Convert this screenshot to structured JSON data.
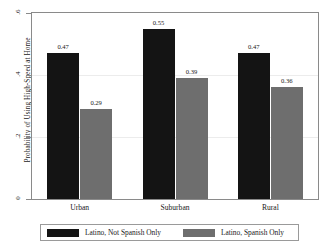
{
  "chart_data": {
    "type": "bar",
    "title": "",
    "subtitle": "",
    "xlabel": "",
    "ylabel": "Probability of Using High-Speed at Home",
    "categories": [
      "Urban",
      "Suburban",
      "Rural"
    ],
    "series": [
      {
        "name": "Latino, Not Spanish Only",
        "color": "#141414",
        "values": [
          0.47,
          0.55,
          0.47
        ],
        "labels": [
          "0.47",
          "0.55",
          "0.47"
        ]
      },
      {
        "name": "Latino, Spanish Only",
        "color": "#6e6e6e",
        "values": [
          0.29,
          0.39,
          0.36
        ],
        "labels": [
          "0.29",
          "0.39",
          "0.36"
        ]
      }
    ],
    "ylim": [
      0,
      0.6
    ],
    "yticks": [
      0,
      0.2,
      0.4,
      0.6
    ],
    "ytick_labels": [
      "0",
      ".2",
      ".4",
      ".6"
    ],
    "grid": true,
    "legend_position": "bottom"
  },
  "axis": {
    "y_title": "Probability of Using High-Speed at Home",
    "ticks": [
      {
        "label": ".6",
        "value": 0.6
      },
      {
        "label": ".4",
        "value": 0.4
      },
      {
        "label": ".2",
        "value": 0.2
      },
      {
        "label": "0",
        "value": 0
      }
    ]
  },
  "groups": [
    {
      "name": "Urban",
      "bars": [
        {
          "series": "Latino, Not Spanish Only",
          "value": 0.47,
          "label": "0.47",
          "color": "#141414"
        },
        {
          "series": "Latino, Spanish Only",
          "value": 0.29,
          "label": "0.29",
          "color": "#6e6e6e"
        }
      ]
    },
    {
      "name": "Suburban",
      "bars": [
        {
          "series": "Latino, Not Spanish Only",
          "value": 0.55,
          "label": "0.55",
          "color": "#141414"
        },
        {
          "series": "Latino, Spanish Only",
          "value": 0.39,
          "label": "0.39",
          "color": "#6e6e6e"
        }
      ]
    },
    {
      "name": "Rural",
      "bars": [
        {
          "series": "Latino, Not Spanish Only",
          "value": 0.47,
          "label": "0.47",
          "color": "#141414"
        },
        {
          "series": "Latino, Spanish Only",
          "value": 0.36,
          "label": "0.36",
          "color": "#6e6e6e"
        }
      ]
    }
  ],
  "legend": {
    "entries": [
      {
        "label": "Latino, Not Spanish Only",
        "color": "#141414"
      },
      {
        "label": "Latino, Spanish Only",
        "color": "#6e6e6e"
      }
    ]
  }
}
